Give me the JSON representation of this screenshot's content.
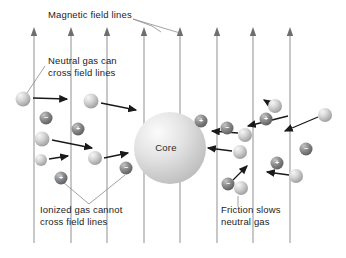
{
  "figure": {
    "width": 346,
    "height": 258,
    "background_color": "#ffffff"
  },
  "colors": {
    "field_line": "#9a9a9a",
    "arrow": "#1a1a1a",
    "leader_line": "#8c8c8c",
    "text": "#1c1c1c",
    "core_light": "#f2f2f2",
    "core_mid": "#d8d8d8",
    "core_dark": "#b4b4b4",
    "neutral_light": "#ededed",
    "neutral_mid": "#c9c9c9",
    "neutral_dark": "#9b9b9b",
    "ion_light": "#b8b8b8",
    "ion_mid": "#8a8a8a",
    "ion_dark": "#5e5e5e",
    "sign_text": "#ffffff"
  },
  "labels": [
    {
      "id": "magnetic-field-lines",
      "name": "label-magnetic-field-lines",
      "lines": [
        "Magnetic field lines"
      ],
      "x": 48,
      "y": 18
    },
    {
      "id": "neutral-gas-can-cross",
      "name": "label-neutral-gas-cross",
      "lines": [
        "Neutral gas can",
        "cross field lines"
      ],
      "x": 48,
      "y": 64
    },
    {
      "id": "ionized-gas-cannot-cross",
      "name": "label-ionized-gas-cannot-cross",
      "lines": [
        "Ionized gas cannot",
        "cross field lines"
      ],
      "x": 40,
      "y": 213
    },
    {
      "id": "friction-slows-neutral-gas",
      "name": "label-friction-slows-neutral-gas",
      "lines": [
        "Friction slows",
        "neutral gas"
      ],
      "x": 221,
      "y": 213
    }
  ],
  "core": {
    "name": "core-sphere",
    "label": "Core",
    "cx": 170,
    "cy": 148,
    "r": 36,
    "label_x": 166,
    "label_y": 151
  },
  "field_lines": {
    "name": "magnetic-field-line",
    "count": 8,
    "top_y": 27,
    "bottom_y": 243,
    "arrow_head_height": 9,
    "x_positions": [
      34,
      71,
      107,
      144,
      180,
      217,
      253,
      290
    ]
  },
  "particles": [
    {
      "name": "neutral-gas-particle",
      "type": "neutral",
      "cx": 23,
      "cy": 99,
      "r": 7.5
    },
    {
      "name": "neutral-gas-particle",
      "type": "neutral",
      "cx": 91,
      "cy": 101,
      "r": 7.5
    },
    {
      "name": "ion-negative-particle",
      "type": "ion",
      "charge": "−",
      "cx": 46,
      "cy": 118,
      "r": 6.5
    },
    {
      "name": "ion-positive-particle",
      "type": "ion",
      "charge": "+",
      "cx": 78,
      "cy": 129,
      "r": 6.5
    },
    {
      "name": "neutral-gas-particle",
      "type": "neutral",
      "cx": 42,
      "cy": 139,
      "r": 7.5
    },
    {
      "name": "neutral-gas-particle",
      "type": "neutral",
      "cx": 41,
      "cy": 160,
      "r": 6.0
    },
    {
      "name": "ion-positive-particle",
      "type": "ion",
      "charge": "+",
      "cx": 61,
      "cy": 178,
      "r": 6.5
    },
    {
      "name": "neutral-gas-particle",
      "type": "neutral",
      "cx": 95,
      "cy": 158,
      "r": 7.0
    },
    {
      "name": "ion-negative-particle",
      "type": "ion",
      "charge": "−",
      "cx": 126,
      "cy": 168,
      "r": 6.5
    },
    {
      "name": "ion-positive-particle",
      "type": "ion",
      "charge": "+",
      "cx": 201,
      "cy": 121,
      "r": 6.5
    },
    {
      "name": "ion-negative-particle",
      "type": "ion",
      "charge": "−",
      "cx": 227,
      "cy": 128,
      "r": 6.5
    },
    {
      "name": "neutral-gas-particle",
      "type": "neutral",
      "cx": 245,
      "cy": 135,
      "r": 7.0
    },
    {
      "name": "neutral-gas-particle",
      "type": "neutral",
      "cx": 240,
      "cy": 152,
      "r": 7.0
    },
    {
      "name": "ion-negative-particle",
      "type": "ion",
      "charge": "−",
      "cx": 228,
      "cy": 184,
      "r": 6.5
    },
    {
      "name": "neutral-gas-particle",
      "type": "neutral",
      "cx": 241,
      "cy": 188,
      "r": 7.0
    },
    {
      "name": "neutral-gas-particle",
      "type": "neutral",
      "cx": 275,
      "cy": 106,
      "r": 7.0
    },
    {
      "name": "ion-positive-particle",
      "type": "ion",
      "charge": "+",
      "cx": 266,
      "cy": 119,
      "r": 6.5
    },
    {
      "name": "neutral-gas-particle",
      "type": "neutral",
      "cx": 325,
      "cy": 115,
      "r": 7.0
    },
    {
      "name": "ion-negative-particle",
      "type": "ion",
      "charge": "−",
      "cx": 306,
      "cy": 149,
      "r": 6.5
    },
    {
      "name": "ion-positive-particle",
      "type": "ion",
      "charge": "+",
      "cx": 277,
      "cy": 163,
      "r": 6.5
    },
    {
      "name": "neutral-gas-particle",
      "type": "neutral",
      "cx": 296,
      "cy": 176,
      "r": 7.0
    }
  ],
  "motion_arrows": [
    {
      "name": "motion-arrow-right",
      "x1": 33,
      "y1": 98,
      "x2": 67,
      "y2": 99
    },
    {
      "name": "motion-arrow-right",
      "x1": 101,
      "y1": 103,
      "x2": 136,
      "y2": 110
    },
    {
      "name": "motion-arrow-right",
      "x1": 52,
      "y1": 140,
      "x2": 92,
      "y2": 148
    },
    {
      "name": "motion-arrow-right",
      "x1": 49,
      "y1": 159,
      "x2": 68,
      "y2": 156
    },
    {
      "name": "motion-arrow-right",
      "x1": 104,
      "y1": 158,
      "x2": 128,
      "y2": 153
    },
    {
      "name": "motion-arrow-left",
      "x1": 238,
      "y1": 133,
      "x2": 212,
      "y2": 131
    },
    {
      "name": "motion-arrow-left",
      "x1": 232,
      "y1": 151,
      "x2": 208,
      "y2": 148
    },
    {
      "name": "motion-arrow-left",
      "x1": 288,
      "y1": 116,
      "x2": 248,
      "y2": 126
    },
    {
      "name": "motion-arrow-left",
      "x1": 318,
      "y1": 117,
      "x2": 285,
      "y2": 131
    },
    {
      "name": "motion-arrow-left",
      "x1": 289,
      "y1": 175,
      "x2": 267,
      "y2": 172
    },
    {
      "name": "motion-arrow-up-left",
      "x1": 277,
      "y1": 108,
      "x2": 264,
      "y2": 100
    },
    {
      "name": "motion-arrow-diagonal-up",
      "x1": 233,
      "y1": 180,
      "x2": 247,
      "y2": 166
    }
  ],
  "leader_lines": [
    {
      "name": "leader-line-magnetic-field",
      "points": "133,19 152,26 161,32"
    },
    {
      "name": "leader-line-magnetic-field",
      "points": "133,19 180,33"
    },
    {
      "name": "leader-line-neutral-gas",
      "points": "45,66 27,93"
    },
    {
      "name": "leader-line-ionized-gas",
      "points": "64,183 89,204 125,175"
    },
    {
      "name": "leader-line-friction",
      "points": "238,196 238,207"
    }
  ]
}
